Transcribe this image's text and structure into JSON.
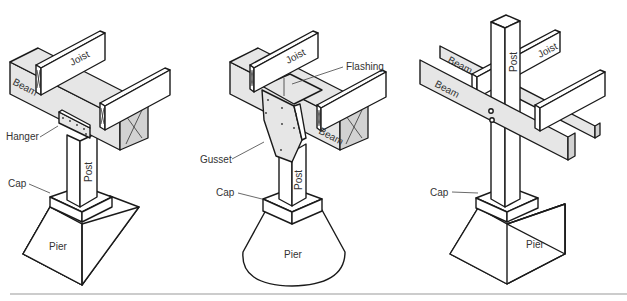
{
  "figure": {
    "rule_color": "#999999",
    "line_color": "#1a1a1a",
    "shade_color": "#e6e6e6",
    "panels": [
      {
        "id": "hanger-detail",
        "labels": {
          "joist": "Joist",
          "beam": "Beam",
          "hanger": "Hanger",
          "post": "Post",
          "cap": "Cap",
          "pier": "Pier"
        }
      },
      {
        "id": "gusset-detail",
        "labels": {
          "joist": "Joist",
          "flashing": "Flashing",
          "beam": "Beam",
          "gusset": "Gusset",
          "post": "Post",
          "cap": "Cap",
          "pier": "Pier"
        }
      },
      {
        "id": "through-post-detail",
        "labels": {
          "beam_back": "Beam",
          "beam_front": "Beam",
          "joist": "Joist",
          "post": "Post",
          "cap": "Cap",
          "pier": "Pier"
        }
      }
    ]
  }
}
